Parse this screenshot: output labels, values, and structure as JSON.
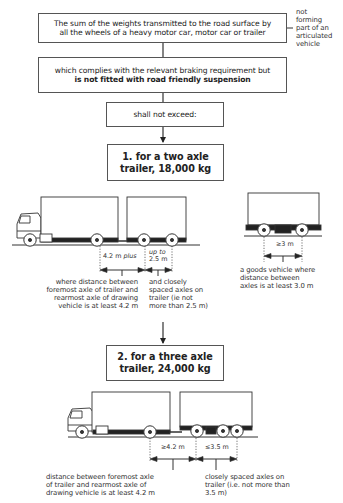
{
  "flowchart": {
    "box1": {
      "line1": "The sum of the weights transmitted to the road surface by",
      "line2": "all the wheels of a heavy motor car, motor car or trailer"
    },
    "side_note": [
      "not",
      "forming",
      "part of an",
      "articulated",
      "vehicle"
    ],
    "box2": {
      "line1": "which complies with the relevant braking requirement but",
      "line2_bold": "is not fitted with road friendly suspension"
    },
    "box3": {
      "text": "shall not exceed:"
    },
    "box4": {
      "line1": "1. for a two axle",
      "line2": "trailer, 18,000 kg"
    },
    "box5": {
      "line1": "2. for a three axle",
      "line2": "trailer, 24,000 kg"
    }
  },
  "two_axle_diagram": {
    "dim1": {
      "value": "4.2 m",
      "suffix": "plus"
    },
    "dim2": {
      "line1": "up to",
      "line2": "2.5 m"
    },
    "caption1": [
      "where distance between",
      "foremost axle of trailer and",
      "rearmost axle of drawing",
      "vehicle is at least 4.2 m"
    ],
    "caption2": [
      "and closely",
      "spaced axles on",
      "trailer (ie not",
      "more than 2.5 m)"
    ]
  },
  "goods_vehicle_diagram": {
    "dim": "≥3 m",
    "caption": [
      "a goods vehicle where",
      "distance between",
      "axles is at least 3.0 m"
    ]
  },
  "three_axle_diagram": {
    "dim1": "≥4.2 m",
    "dim2": "≤3.5 m",
    "caption1": [
      "distance between foremost axle",
      "of trailer and rearmost axle of",
      "drawing vehicle is at least 4.2 m"
    ],
    "caption2": [
      "closely spaced axles on",
      "trailer (i.e. not more than",
      "3.5 m)"
    ]
  }
}
